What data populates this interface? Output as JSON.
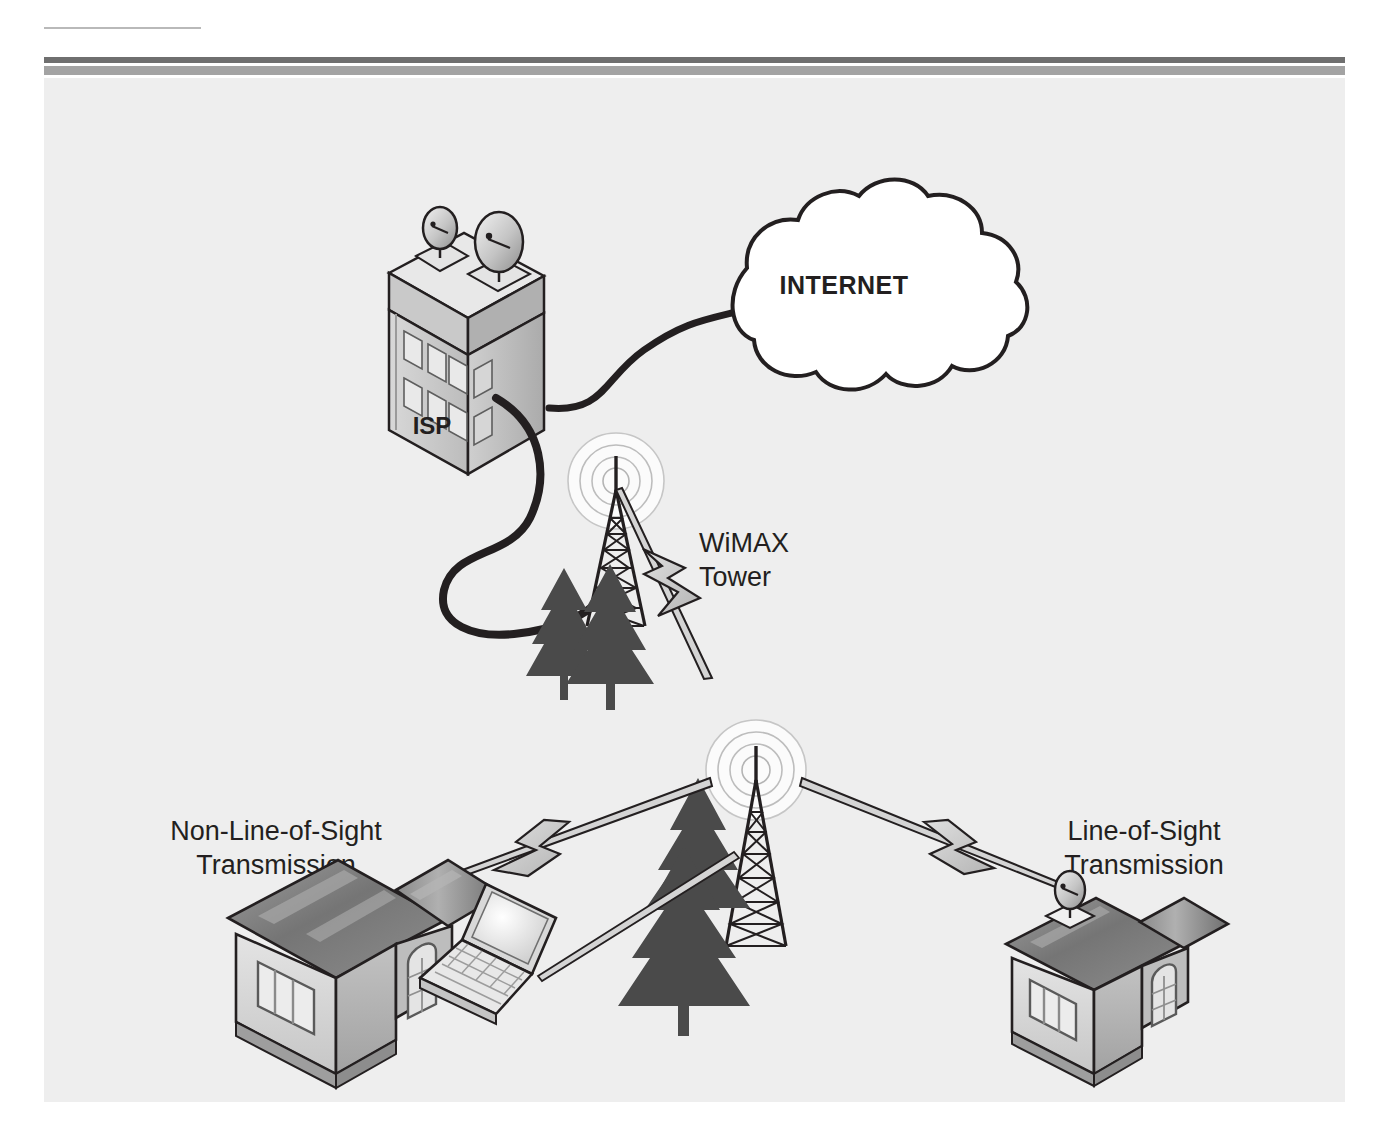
{
  "figure": {
    "background_color": "#eeeeee",
    "page_color": "#ffffff",
    "rule_dark_color": "#6f6f6f",
    "rule_light_color": "#a3a3a3",
    "top_rule_color": "#b9b9b9"
  },
  "nodes": {
    "internet": {
      "label": "INTERNET",
      "shape": "cloud",
      "x": 760,
      "y": 148,
      "font_size": 25,
      "bold": true
    },
    "isp": {
      "label": "ISP",
      "shape": "building",
      "x": 388,
      "y": 348,
      "font_size": 24,
      "bold": true,
      "dish_count": 2,
      "window_count": 8
    },
    "wimax_tower": {
      "label_line1": "WiMAX",
      "label_line2": "Tower",
      "shape": "tower-with-signal-rings",
      "x": 611,
      "y": 400,
      "font_size": 27,
      "bold": false,
      "ring_count": 4
    },
    "relay_tower": {
      "label": "",
      "shape": "tower-with-signal-rings",
      "x": 663,
      "y": 610,
      "ring_count": 4
    },
    "house_left": {
      "label_line1": "Non-Line-of-Sight",
      "label_line2": "Transmission",
      "shape": "house",
      "x": 232,
      "y": 650,
      "font_size": 27,
      "bold": false,
      "has_dish": false
    },
    "house_right": {
      "label_line1": "Line-of-Sight",
      "label_line2": "Transmission",
      "shape": "house-with-dish",
      "x": 960,
      "y": 655,
      "font_size": 27,
      "bold": false,
      "has_dish": true
    },
    "laptop": {
      "label": "",
      "shape": "laptop",
      "x": 480,
      "y": 860
    }
  },
  "links": [
    {
      "from": "isp",
      "to": "internet",
      "type": "cable",
      "style": "thick-black-curve"
    },
    {
      "from": "isp",
      "to": "wimax_tower",
      "type": "cable",
      "style": "thick-black-curve"
    },
    {
      "from": "wimax_tower",
      "to": "relay_tower",
      "type": "wireless",
      "style": "beam-with-lightning-bolt"
    },
    {
      "from": "relay_tower",
      "to": "house_left",
      "type": "wireless",
      "style": "beam-with-lightning-bolt"
    },
    {
      "from": "relay_tower",
      "to": "house_right",
      "type": "wireless",
      "style": "beam-with-lightning-bolt"
    },
    {
      "from": "relay_tower",
      "to": "laptop",
      "type": "wireless",
      "style": "beam-plain"
    }
  ],
  "colors": {
    "outline": "#231f20",
    "tree_fill": "#4a4a4a",
    "bolt_fill": "#c9c9c9",
    "beam_fill": "#d4d4d4",
    "roof_dark": "#7d7d7d",
    "roof_mid": "#9a9a9a",
    "wall_light": "#dcdcdc",
    "wall_shade": "#b5b5b5",
    "ring_stroke": "#bdbdbd",
    "ring_fill": "#fbfbfb",
    "cloud_fill": "#ffffff"
  }
}
